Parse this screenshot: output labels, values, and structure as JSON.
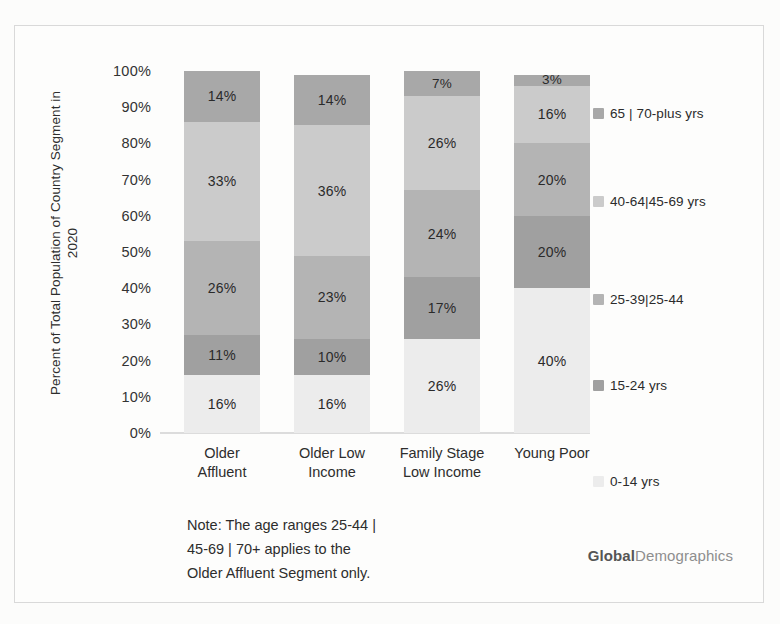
{
  "chart_data": {
    "type": "bar",
    "subtype": "stacked-100-percent",
    "title": "",
    "xlabel": "",
    "ylabel": "Percent of Total Population of Country Segment in 2020",
    "ylim": [
      0,
      100
    ],
    "ytick_labels": [
      "0%",
      "10%",
      "20%",
      "30%",
      "40%",
      "50%",
      "60%",
      "70%",
      "80%",
      "90%",
      "100%"
    ],
    "ytick_values": [
      0,
      10,
      20,
      30,
      40,
      50,
      60,
      70,
      80,
      90,
      100
    ],
    "grid": false,
    "legend_position": "right",
    "categories": [
      "Older Affluent",
      "Older Low Income",
      "Family Stage Low Income",
      "Young Poor"
    ],
    "category_lines": [
      [
        "Older",
        "Affluent"
      ],
      [
        "Older Low",
        "Income"
      ],
      [
        "Family Stage",
        "Low Income"
      ],
      [
        "Young Poor",
        ""
      ]
    ],
    "series": [
      {
        "name": "0-14 yrs",
        "color": "#ececec",
        "values": [
          16,
          16,
          26,
          40
        ]
      },
      {
        "name": "15-24 yrs",
        "color": "#a0a0a0",
        "values": [
          11,
          10,
          17,
          20
        ]
      },
      {
        "name": "25-39|25-44",
        "color": "#b4b4b4",
        "values": [
          26,
          23,
          24,
          20
        ]
      },
      {
        "name": "40-64|45-69 yrs",
        "color": "#cbcbcb",
        "values": [
          33,
          36,
          26,
          16
        ]
      },
      {
        "name": "65 | 70-plus yrs",
        "color": "#a8a8a8",
        "values": [
          14,
          14,
          7,
          3
        ]
      }
    ],
    "data_labels": [
      [
        "16%",
        "11%",
        "26%",
        "33%",
        "14%"
      ],
      [
        "16%",
        "10%",
        "23%",
        "36%",
        "14%"
      ],
      [
        "26%",
        "17%",
        "24%",
        "26%",
        "7%"
      ],
      [
        "40%",
        "20%",
        "20%",
        "16%",
        "3%"
      ]
    ],
    "annotations": [
      "Note: The age ranges 25-44 |",
      "45-69 | 70+ applies to the",
      "Older Affluent Segment only."
    ]
  },
  "legend": {
    "entries": [
      {
        "label": "65 | 70-plus yrs",
        "color": "#a8a8a8"
      },
      {
        "label": "40-64|45-69 yrs",
        "color": "#cbcbcb"
      },
      {
        "label": "25-39|25-44",
        "color": "#b4b4b4"
      },
      {
        "label": "15-24 yrs",
        "color": "#a0a0a0"
      },
      {
        "label": "0-14 yrs",
        "color": "#ececec"
      }
    ]
  },
  "note": {
    "line1": "Note: The age ranges 25-44 |",
    "line2": "45-69 | 70+ applies to the",
    "line3": "Older Affluent Segment only."
  },
  "branding": {
    "primary": "Global",
    "secondary": "Demographics"
  }
}
